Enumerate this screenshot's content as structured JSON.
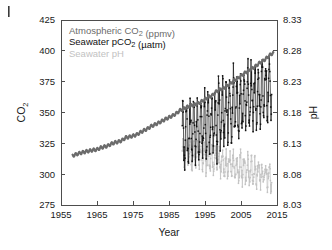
{
  "figure": {
    "corner_mark": "|",
    "background": "#ffffff"
  },
  "chart_data": {
    "type": "line",
    "title": "",
    "xlabel": "Year",
    "ylabel": "CO2",
    "y2label": "pH",
    "xlim": [
      1955,
      2015
    ],
    "ylim": [
      275,
      425
    ],
    "y2lim": [
      8.03,
      8.33
    ],
    "grid": false,
    "legend_position": "top-left-inside",
    "xticks": [
      1955,
      1965,
      1975,
      1985,
      1995,
      2005,
      2015
    ],
    "xtick_labels": [
      "1955",
      "1965",
      "1975",
      "1985",
      "1995",
      "2005",
      "2015"
    ],
    "yticks": [
      275,
      300,
      325,
      350,
      375,
      400,
      425
    ],
    "ytick_labels": [
      "275",
      "300",
      "325",
      "350",
      "375",
      "400",
      "425"
    ],
    "y2ticks": [
      8.03,
      8.08,
      8.13,
      8.18,
      8.23,
      8.28,
      8.33
    ],
    "y2tick_labels": [
      "8.03",
      "8.08",
      "8.13",
      "8.18",
      "8.23",
      "8.28",
      "8.33"
    ],
    "legend": [
      {
        "label": "Atmospheric CO2 (ppmv)",
        "color": "#6b6b6b",
        "axis": "left"
      },
      {
        "label": "Seawater pCO2 (µatm)",
        "color": "#111111",
        "axis": "left"
      },
      {
        "label": "Seawater pH",
        "color": "#c2c2c2",
        "axis": "right"
      }
    ],
    "legend_html": [
      "Atmospheric CO<sub>2</sub> (ppmv)",
      "Seawater pCO<sub>2</sub> (µatm)",
      "Seawater pH"
    ],
    "series": [
      {
        "name": "Atmospheric CO2 (ppmv)",
        "color": "#6b6b6b",
        "axis": "left",
        "style": "line",
        "linewidth": 2.1,
        "x": [
          1958.2,
          1959,
          1960,
          1961,
          1962,
          1963,
          1964,
          1965,
          1966,
          1967,
          1968,
          1969,
          1970,
          1971,
          1972,
          1973,
          1974,
          1975,
          1976,
          1977,
          1978,
          1979,
          1980,
          1981,
          1982,
          1983,
          1984,
          1985,
          1986,
          1987,
          1988,
          1989,
          1990,
          1991,
          1992,
          1993,
          1994,
          1995,
          1996,
          1997,
          1998,
          1999,
          2000,
          2001,
          2002,
          2003,
          2004,
          2005,
          2006,
          2007,
          2008,
          2009,
          2010,
          2011,
          2012,
          2013,
          2014
        ],
        "y": [
          315.0,
          315.8,
          316.9,
          317.6,
          318.4,
          319.0,
          319.6,
          320.0,
          321.4,
          322.2,
          323.0,
          324.6,
          325.7,
          326.3,
          327.5,
          329.7,
          330.2,
          331.1,
          332.0,
          333.8,
          335.4,
          336.8,
          338.8,
          340.1,
          341.4,
          343.0,
          344.6,
          346.0,
          347.4,
          349.2,
          351.6,
          353.1,
          354.4,
          355.6,
          356.4,
          357.1,
          358.8,
          360.8,
          362.6,
          363.7,
          366.7,
          368.4,
          369.5,
          371.1,
          373.2,
          375.8,
          377.5,
          379.8,
          381.9,
          383.8,
          385.6,
          387.4,
          389.9,
          391.6,
          393.8,
          396.5,
          398.6
        ]
      },
      {
        "name": "Seawater pCO2 (µatm)",
        "color": "#111111",
        "axis": "left",
        "style": "line-markers",
        "linewidth": 0.7,
        "marker_size": 1.5,
        "description": "Monthly seawater pCO2 with strong seasonal oscillation, rising trend from ~1988.7 to ~2013.5",
        "trend_start": [
          1988.7,
          330
        ],
        "trend_end": [
          2013.5,
          372
        ],
        "seasonal_amplitude": 22,
        "noise": 9,
        "x_start": 1988.7,
        "x_end": 2013.5,
        "n_points": 300
      },
      {
        "name": "Seawater pH",
        "color": "#c2c2c2",
        "axis": "right",
        "style": "line-markers",
        "linewidth": 0.7,
        "marker_size": 1.5,
        "description": "Monthly seawater pH with seasonal oscillation, declining trend from ~1988.7 to ~2013.5",
        "trend_start": [
          1988.7,
          8.117
        ],
        "trend_end": [
          2013.5,
          8.075
        ],
        "seasonal_amplitude": 0.018,
        "noise": 0.009,
        "x_start": 1988.7,
        "x_end": 2013.5,
        "n_points": 300
      }
    ]
  }
}
